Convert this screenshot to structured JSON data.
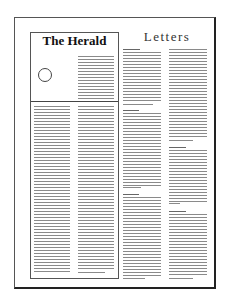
{
  "diagram": {
    "type": "newspaper-page-layout",
    "frame": {
      "border_color": "#555555",
      "shadow_color": "#222222"
    },
    "boxed_article": {
      "masthead": "The Herald",
      "photo_placeholder": "circle",
      "columns": 2
    },
    "letters_section": {
      "heading": "Letters",
      "columns": [
        {
          "letters": 3
        },
        {
          "letters": 3
        }
      ]
    },
    "text_line_color": "#8a8a8a"
  }
}
